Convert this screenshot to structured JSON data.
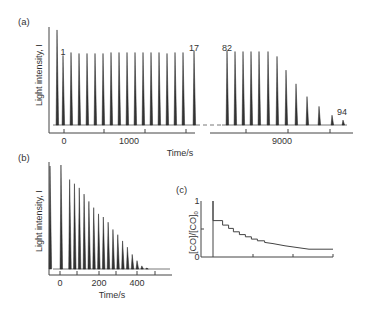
{
  "chart_data": [
    {
      "panel": "(a)",
      "type": "line",
      "title": "",
      "xlabel": "Time/s",
      "ylabel": "Light intensity, I",
      "x_ticks": [
        "0",
        "1000",
        "9000"
      ],
      "axis_break": true,
      "peak_labels": [
        "1",
        "17",
        "82",
        "94"
      ],
      "segment1": {
        "description": "initial flash then pulses 1-17 at near-constant height",
        "peak_x_px": [
          57,
          63,
          71,
          79,
          87,
          95,
          103,
          111,
          119,
          127,
          135,
          143,
          151,
          159,
          167,
          175,
          183,
          194
        ],
        "peak_heights": [
          0.97,
          0.71,
          0.74,
          0.73,
          0.73,
          0.73,
          0.73,
          0.74,
          0.74,
          0.74,
          0.74,
          0.74,
          0.74,
          0.74,
          0.73,
          0.74,
          0.74,
          0.76
        ]
      },
      "segment2": {
        "description": "pulses 82-94 decaying",
        "peak_x_px": [
          227,
          235,
          243,
          251,
          259,
          268,
          277,
          286,
          296,
          307,
          319,
          332,
          343
        ],
        "peak_heights": [
          0.76,
          0.75,
          0.75,
          0.75,
          0.75,
          0.75,
          0.7,
          0.56,
          0.42,
          0.29,
          0.19,
          0.1,
          0.05
        ]
      }
    },
    {
      "panel": "(b)",
      "type": "line",
      "xlabel": "Time/s",
      "ylabel": "Light intensity, I",
      "x_ticks": [
        "0",
        "200",
        "400"
      ],
      "xlim": [
        -40,
        560
      ],
      "peak_times": [
        5,
        50,
        75,
        100,
        125,
        150,
        175,
        200,
        225,
        250,
        275,
        300,
        325,
        350,
        375,
        400,
        425,
        450
      ],
      "peak_heights": [
        1.0,
        0.86,
        0.82,
        0.78,
        0.72,
        0.65,
        0.59,
        0.53,
        0.5,
        0.45,
        0.38,
        0.33,
        0.27,
        0.21,
        0.14,
        0.08,
        0.03,
        0.01
      ]
    },
    {
      "panel": "(c)",
      "type": "line",
      "xlabel": "",
      "ylabel": "[CO]/[CO]0",
      "y_ticks": [
        "0",
        "1"
      ],
      "ylim": [
        0,
        1
      ],
      "description": "staircase decay of CO fraction",
      "x_norm": [
        0.0,
        0.0,
        0.08,
        0.08,
        0.13,
        0.13,
        0.17,
        0.17,
        0.22,
        0.22,
        0.27,
        0.27,
        0.32,
        0.32,
        0.37,
        0.37,
        0.43,
        0.43,
        0.5,
        0.6,
        0.7,
        0.8,
        1.0
      ],
      "y_values": [
        1.0,
        0.65,
        0.65,
        0.57,
        0.57,
        0.51,
        0.51,
        0.45,
        0.45,
        0.4,
        0.4,
        0.36,
        0.36,
        0.32,
        0.32,
        0.29,
        0.29,
        0.26,
        0.24,
        0.2,
        0.17,
        0.14,
        0.14
      ]
    }
  ],
  "labels": {
    "a": "(a)",
    "b": "(b)",
    "c": "(c)",
    "a_xlabel": "Time/s",
    "a_ylabel": "Light intensity, I",
    "b_xlabel": "Time/s",
    "b_ylabel": "Light intensity, I",
    "c_ylabel": "[CO]/[CO]",
    "c_ylabel_sub": "0",
    "a_tick0": "0",
    "a_tick1": "1000",
    "a_tick2": "9000",
    "b_tick0": "0",
    "b_tick1": "200",
    "b_tick2": "400",
    "c_y0": "0",
    "c_y1": "1",
    "pk1": "1",
    "pk17": "17",
    "pk82": "82",
    "pk94": "94"
  }
}
